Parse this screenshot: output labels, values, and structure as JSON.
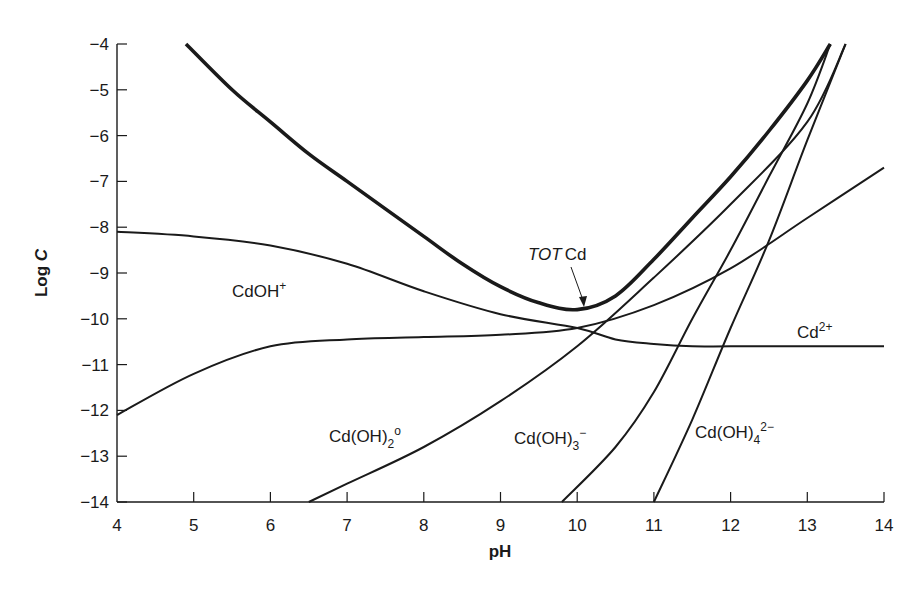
{
  "chart_data": {
    "type": "line",
    "title": "",
    "xlabel": "pH",
    "ylabel": "Log C",
    "xlim": [
      4,
      14
    ],
    "ylim": [
      -14,
      -4
    ],
    "xticks": [
      4,
      5,
      6,
      7,
      8,
      9,
      10,
      11,
      12,
      13,
      14
    ],
    "yticks": [
      -4,
      -5,
      -6,
      -7,
      -8,
      -9,
      -10,
      -11,
      -12,
      -13,
      -14
    ],
    "grid": false,
    "legend": "none (inline labels)",
    "series": [
      {
        "name": "TOT Cd",
        "style": "thick",
        "x": [
          4.9,
          5.5,
          6.0,
          6.5,
          7.0,
          7.5,
          8.0,
          8.5,
          9.0,
          9.5,
          10.0,
          10.5,
          11.0,
          11.5,
          12.0,
          12.5,
          13.0,
          13.3
        ],
        "y": [
          -4.0,
          -5.0,
          -5.7,
          -6.4,
          -7.0,
          -7.6,
          -8.2,
          -8.8,
          -9.3,
          -9.65,
          -9.8,
          -9.5,
          -8.7,
          -7.8,
          -6.9,
          -5.9,
          -4.8,
          -4.0
        ]
      },
      {
        "name": "Cd2+",
        "x": [
          4.0,
          5.0,
          6.0,
          7.0,
          8.0,
          9.0,
          10.0,
          10.5,
          11.0,
          11.5,
          12.0,
          13.0,
          14.0
        ],
        "y": [
          -8.1,
          -8.2,
          -8.4,
          -8.8,
          -9.4,
          -9.9,
          -10.2,
          -10.45,
          -10.55,
          -10.6,
          -10.6,
          -10.6,
          -10.6
        ]
      },
      {
        "name": "CdOH+",
        "x": [
          4.0,
          5.0,
          6.0,
          7.0,
          8.0,
          9.0,
          10.0,
          11.0,
          12.0,
          13.0,
          14.0
        ],
        "y": [
          -12.1,
          -11.2,
          -10.6,
          -10.45,
          -10.4,
          -10.35,
          -10.2,
          -9.7,
          -8.9,
          -7.8,
          -6.7
        ]
      },
      {
        "name": "Cd(OH)2o",
        "x": [
          6.5,
          7.0,
          8.0,
          9.0,
          10.0,
          11.0,
          12.0,
          13.0,
          13.5
        ],
        "y": [
          -14.0,
          -13.6,
          -12.8,
          -11.8,
          -10.6,
          -9.1,
          -7.5,
          -5.7,
          -4.0
        ]
      },
      {
        "name": "Cd(OH)3-",
        "x": [
          9.8,
          10.5,
          11.0,
          11.5,
          12.0,
          12.5,
          13.0,
          13.3
        ],
        "y": [
          -14.0,
          -12.8,
          -11.6,
          -10.0,
          -8.5,
          -6.9,
          -5.3,
          -4.0
        ]
      },
      {
        "name": "Cd(OH)4 2-",
        "x": [
          11.0,
          11.5,
          12.0,
          12.5,
          13.0,
          13.5
        ],
        "y": [
          -14.0,
          -12.2,
          -10.2,
          -8.3,
          -6.1,
          -4.0
        ]
      }
    ],
    "annotations": [
      {
        "text": "TOT Cd",
        "arrow_to": [
          10.0,
          -9.75
        ]
      },
      {
        "text": "CdOH+",
        "at": [
          5.9,
          -9.0
        ]
      },
      {
        "text": "Cd2+",
        "at": [
          13.0,
          -10.4
        ]
      },
      {
        "text": "Cd(OH)2o",
        "at": [
          7.5,
          -12.6
        ]
      },
      {
        "text": "Cd(OH)3-",
        "at": [
          10.2,
          -12.6
        ]
      },
      {
        "text": "Cd(OH)4 2-",
        "at": [
          12.0,
          -12.5
        ]
      }
    ]
  },
  "labels": {
    "x_axis_title": "pH",
    "y_axis_title_main": "Log ",
    "y_axis_title_italic": "C",
    "tot_italic": "TOT",
    "tot_rest": "Cd",
    "cdoh_base": "CdOH",
    "cdoh_sup": "+",
    "cd2_base": "Cd",
    "cd2_sup": "2+",
    "cdoh2_base": "Cd(OH)",
    "cdoh2_sub": "2",
    "cdoh2_sup": "o",
    "cdoh3_base": "Cd(OH)",
    "cdoh3_sub": "3",
    "cdoh3_sup": "−",
    "cdoh4_base": "Cd(OH)",
    "cdoh4_sub": "4",
    "cdoh4_sup": "2−"
  },
  "x_tick_labels": [
    "4",
    "5",
    "6",
    "7",
    "8",
    "9",
    "10",
    "11",
    "12",
    "13",
    "14"
  ],
  "y_tick_labels": [
    "−4",
    "−5",
    "−6",
    "−7",
    "−8",
    "−9",
    "−10",
    "−11",
    "−12",
    "−13",
    "−14"
  ],
  "colors": {
    "ink": "#1a1a1a",
    "background": "#ffffff"
  }
}
